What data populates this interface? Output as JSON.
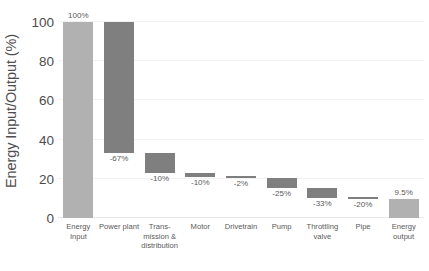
{
  "chart_data": {
    "type": "bar",
    "chart_subtype": "waterfall",
    "title": "",
    "subtitle": "",
    "xlabel": "",
    "ylabel": "Energy Input/Output (%)",
    "ylim": [
      0,
      100
    ],
    "yticks": [
      0,
      20,
      40,
      60,
      80,
      100
    ],
    "ytick_labels": [
      "0",
      "20",
      "40",
      "60",
      "80",
      "100"
    ],
    "grid": true,
    "legend": "none",
    "categories": [
      "Energy\nInput",
      "Power plant",
      "Trans-\nmission &\ndistribution",
      "Motor",
      "Drivetrain",
      "Pump",
      "Throttling\nvalve",
      "Pipe",
      "Energy\noutput"
    ],
    "data_labels": [
      "100%",
      "-67%",
      "-10%",
      "-10%",
      "-2%",
      "-25%",
      "-33%",
      "-20%",
      "9.5%"
    ],
    "bars": [
      {
        "category": "Energy Input",
        "kind": "total",
        "base": 0,
        "top": 100,
        "value": 100,
        "label": "100%",
        "label_pos": "above",
        "color": "#b1b1b1"
      },
      {
        "category": "Power plant",
        "kind": "delta",
        "base": 33,
        "top": 100,
        "value": -67,
        "label": "-67%",
        "label_pos": "below",
        "color": "#7f7f7f"
      },
      {
        "category": "Trans-mission & distribution",
        "kind": "delta",
        "base": 23,
        "top": 33,
        "value": -10,
        "label": "-10%",
        "label_pos": "below",
        "color": "#7f7f7f"
      },
      {
        "category": "Motor",
        "kind": "delta",
        "base": 20.7,
        "top": 23,
        "value": -10,
        "label": "-10%",
        "label_pos": "below",
        "color": "#7f7f7f"
      },
      {
        "category": "Drivetrain",
        "kind": "delta",
        "base": 20.3,
        "top": 20.7,
        "value": -2,
        "label": "-2%",
        "label_pos": "below",
        "color": "#7f7f7f"
      },
      {
        "category": "Pump",
        "kind": "delta",
        "base": 15.2,
        "top": 20.3,
        "value": -25,
        "label": "-25%",
        "label_pos": "below",
        "color": "#7f7f7f"
      },
      {
        "category": "Throttling valve",
        "kind": "delta",
        "base": 10.2,
        "top": 15.2,
        "value": -33,
        "label": "-33%",
        "label_pos": "below",
        "color": "#7f7f7f"
      },
      {
        "category": "Pipe",
        "kind": "delta",
        "base": 9.5,
        "top": 10.2,
        "value": -20,
        "label": "-20%",
        "label_pos": "below",
        "color": "#7f7f7f"
      },
      {
        "category": "Energy output",
        "kind": "total",
        "base": 0,
        "top": 9.5,
        "value": 9.5,
        "label": "9.5%",
        "label_pos": "above",
        "color": "#b1b1b1"
      }
    ],
    "colors": {
      "total_bar": "#b1b1b1",
      "delta_bar": "#7f7f7f",
      "gridline": "#f2f2f2",
      "axis_text": "#4d4d4d",
      "label_text": "#5a5a5a",
      "background": "#ffffff"
    }
  }
}
